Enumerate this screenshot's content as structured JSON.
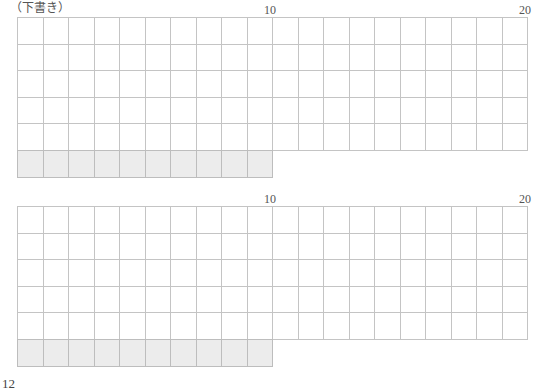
{
  "draft_label": "（下書き）",
  "grids": [
    {
      "name": "grid-1",
      "top": 17,
      "columns": 20,
      "full_rows": 5,
      "shaded_row_cells": 10,
      "column_markers": [
        {
          "column": 10,
          "label": "10"
        },
        {
          "column": 20,
          "label": "20"
        }
      ]
    },
    {
      "name": "grid-2",
      "top": 206,
      "columns": 20,
      "full_rows": 5,
      "shaded_row_cells": 10,
      "column_markers": [
        {
          "column": 10,
          "label": "10"
        },
        {
          "column": 20,
          "label": "20"
        }
      ]
    }
  ],
  "colors": {
    "grid_line": "#c4c4c4",
    "shaded_cell": "#ececec",
    "text": "#555555"
  },
  "page_number_partial": "12"
}
